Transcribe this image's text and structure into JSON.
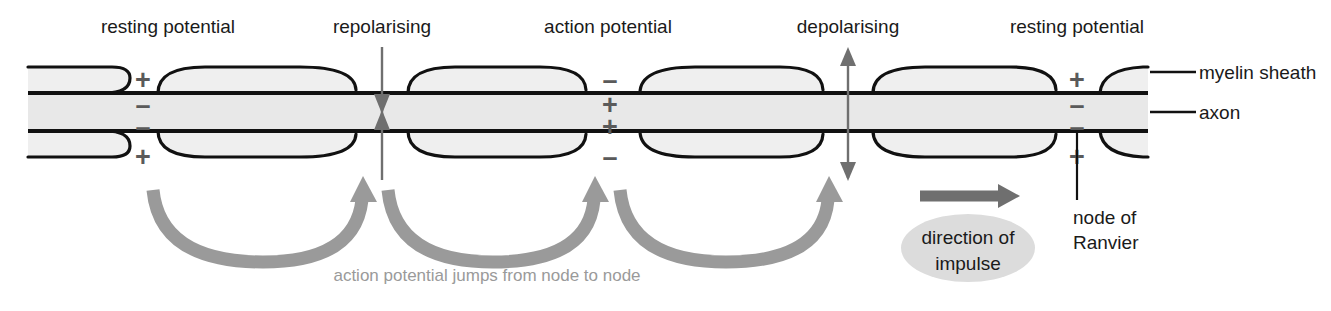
{
  "diagram": {
    "colors": {
      "stroke": "#111111",
      "myelin_fill": "#eeeeee",
      "axon_fill": "#e6e6e6",
      "sign_gray": "#5a5a5a",
      "arrow_gray": "#8e8e8e",
      "solid_arrow_gray": "#6f6f6f",
      "bubble_gray": "#d8d8d8",
      "caption_gray": "#9a9a9a",
      "background": "#ffffff"
    },
    "top_labels": [
      {
        "id": "resting-potential-left",
        "text": "resting potential",
        "x": 168,
        "y": 33
      },
      {
        "id": "repolarising",
        "text": "repolarising",
        "x": 382,
        "y": 33
      },
      {
        "id": "action-potential",
        "text": "action potential",
        "x": 608,
        "y": 33
      },
      {
        "id": "depolarising",
        "text": "depolarising",
        "x": 848,
        "y": 33
      },
      {
        "id": "resting-potential-right",
        "text": "resting potential",
        "x": 1077,
        "y": 33
      }
    ],
    "leader_labels": [
      {
        "id": "myelin-sheath",
        "text": "myelin sheath",
        "x": 1204,
        "y": 79
      },
      {
        "id": "axon",
        "text": "axon",
        "x": 1204,
        "y": 117
      }
    ],
    "node_of_ranvier": {
      "line1": "node of",
      "line2": "Ranvier",
      "x": 1077,
      "y": 224
    },
    "charge_groups": [
      {
        "id": "node-charges-resting-left",
        "x": 143,
        "state": "resting potential",
        "outer_top": "+",
        "inner_top": "–",
        "inner_bottom": "–",
        "outer_bottom": "+"
      },
      {
        "id": "node-charges-action-potential",
        "x": 610,
        "state": "action potential",
        "outer_top": "–",
        "inner_top": "+",
        "inner_bottom": "+",
        "outer_bottom": "–"
      },
      {
        "id": "node-charges-resting-right",
        "x": 1077,
        "state": "resting potential",
        "outer_top": "+",
        "inner_top": "–",
        "inner_bottom": "–",
        "outer_bottom": "+"
      }
    ],
    "vertical_markers": [
      {
        "id": "repolarising-marker",
        "x": 382,
        "type": "converging-double-arrow"
      },
      {
        "id": "depolarising-marker",
        "x": 848,
        "type": "diverging-double-arrow"
      }
    ],
    "jump_arrows": [
      {
        "id": "jump-arrow-1",
        "from_x": 155,
        "to_x": 372
      },
      {
        "id": "jump-arrow-2",
        "from_x": 385,
        "to_x": 600
      },
      {
        "id": "jump-arrow-3",
        "from_x": 618,
        "to_x": 833
      }
    ],
    "caption": {
      "text": "action potential jumps from node to node",
      "x": 487,
      "y": 281
    },
    "direction_arrow": {
      "id": "direction-of-impulse-arrow",
      "x1": 920,
      "y": 196,
      "x2": 1018
    },
    "impulse_bubble": {
      "line1": "direction of",
      "line2": "impulse",
      "cx": 968,
      "cy": 248,
      "rx": 67,
      "ry": 34
    }
  }
}
